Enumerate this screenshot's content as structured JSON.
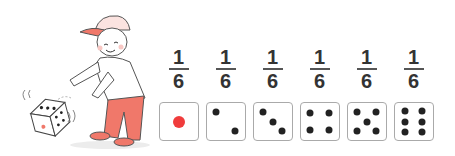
{
  "illustration": {
    "description": "Boy in red cap and red pants tossing a die",
    "colors": {
      "accent": "#f0786a",
      "outline": "#444444"
    }
  },
  "probabilities": [
    {
      "numerator": "1",
      "denominator": "6",
      "face": 1
    },
    {
      "numerator": "1",
      "denominator": "6",
      "face": 2
    },
    {
      "numerator": "1",
      "denominator": "6",
      "face": 3
    },
    {
      "numerator": "1",
      "denominator": "6",
      "face": 4
    },
    {
      "numerator": "1",
      "denominator": "6",
      "face": 5
    },
    {
      "numerator": "1",
      "denominator": "6",
      "face": 6
    }
  ],
  "colors": {
    "one_pip": "#f03c3c",
    "pip": "#222222",
    "face_border": "#aaaaaa"
  }
}
